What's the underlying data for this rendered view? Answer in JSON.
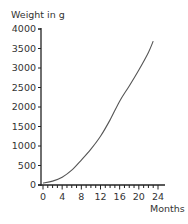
{
  "chart_data": {
    "type": "line",
    "title": "",
    "ylabel": "Weight in g",
    "xlabel": "Months",
    "xlim": [
      0,
      24
    ],
    "ylim": [
      0,
      4000
    ],
    "grid": false,
    "legend": null,
    "x_ticks": [
      0,
      4,
      8,
      12,
      16,
      20,
      24
    ],
    "x_tick_labels": [
      "0",
      "4",
      "8",
      "12",
      "16",
      "20",
      "24"
    ],
    "x_minor_step": 1,
    "y_ticks": [
      0,
      500,
      1000,
      1500,
      2000,
      2500,
      3000,
      3500,
      4000
    ],
    "y_tick_labels": [
      "0",
      "500",
      "1000",
      "1500",
      "2000",
      "2500",
      "3000",
      "3500",
      "4000"
    ],
    "series": [
      {
        "name": "Weight",
        "x": [
          0,
          2,
          4,
          6,
          8,
          10,
          12,
          14,
          16,
          18,
          20,
          22,
          23
        ],
        "values": [
          50,
          100,
          200,
          380,
          640,
          920,
          1250,
          1670,
          2150,
          2540,
          2950,
          3400,
          3690
        ]
      }
    ]
  },
  "labels": {
    "ylabel": "Weight in g",
    "xlabel": "Months"
  },
  "colors": {
    "axis": "#222222",
    "line": "#555555",
    "text": "#333333"
  }
}
